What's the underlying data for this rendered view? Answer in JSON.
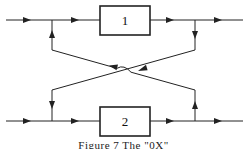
{
  "diagram": {
    "boxes": [
      {
        "id": "1",
        "label": "1"
      },
      {
        "id": "2",
        "label": "2"
      }
    ],
    "caption": "Figure 7   The \"0X\"",
    "colors": {
      "line": "#222222",
      "background": "#ffffff"
    }
  }
}
